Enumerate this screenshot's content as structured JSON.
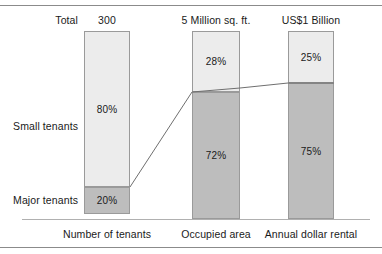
{
  "chart_data": {
    "type": "bar",
    "subtype": "stacked-100-percent",
    "title": "",
    "xlabel": "",
    "ylabel": "",
    "grid": false,
    "legend_position": "left-row-labels",
    "row_labels": {
      "total": "Total",
      "upper": "Small tenants",
      "lower": "Major tenants"
    },
    "categories": [
      "Number of tenants",
      "Occupied area",
      "Annual dollar rental"
    ],
    "category_totals": [
      "300",
      "5 Million sq. ft.",
      "US$1 Billion"
    ],
    "series": [
      {
        "name": "Small tenants",
        "values": [
          80,
          28,
          25
        ],
        "labels": [
          "80%",
          "28%",
          "25%"
        ],
        "color": "#ececec"
      },
      {
        "name": "Major tenants",
        "values": [
          20,
          72,
          75
        ],
        "labels": [
          "20%",
          "72%",
          "75%"
        ],
        "color": "#bdbdbd"
      }
    ],
    "ylim": [
      0,
      100
    ],
    "connector_line": {
      "description": "line joining the tops of the Major tenants segments across categories",
      "color": "#6f6f6f",
      "points": [
        [
          130,
          187
        ],
        [
          192,
          92
        ],
        [
          240,
          88
        ],
        [
          288,
          83
        ],
        [
          334,
          83
        ]
      ]
    }
  },
  "bars": [
    {
      "id": "number-of-tenants",
      "x": 84,
      "width": 46,
      "header": "300",
      "caption": "Number of tenants",
      "top_label": "80%",
      "bottom_label": "20%",
      "top_y": 31,
      "split_y": 187,
      "base_y": 214
    },
    {
      "id": "occupied-area",
      "x": 192,
      "width": 48,
      "header": "5 Million sq. ft.",
      "caption": "Occupied area",
      "top_label": "28%",
      "bottom_label": "72%",
      "top_y": 31,
      "split_y": 92,
      "base_y": 219
    },
    {
      "id": "annual-dollar-rental",
      "x": 288,
      "width": 46,
      "header": "US$1 Billion",
      "caption": "Annual dollar rental",
      "top_label": "25%",
      "bottom_label": "75%",
      "top_y": 31,
      "split_y": 83,
      "base_y": 219
    }
  ]
}
